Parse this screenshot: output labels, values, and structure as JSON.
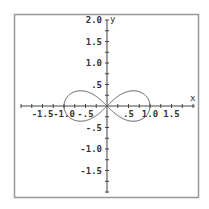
{
  "chart_data": {
    "type": "line",
    "title": "",
    "xlabel": "x",
    "ylabel": "y",
    "xlim": [
      -2.0,
      2.0
    ],
    "ylim": [
      -2.0,
      2.0
    ],
    "grid": false,
    "legend": null,
    "x_ticks": [
      {
        "value": -1.5,
        "label": "-1.5"
      },
      {
        "value": -1.0,
        "label": "-1.0"
      },
      {
        "value": -0.5,
        "label": "-.5"
      },
      {
        "value": 0.5,
        "label": ".5"
      },
      {
        "value": 1.0,
        "label": "1.0"
      },
      {
        "value": 1.5,
        "label": "1.5"
      }
    ],
    "y_ticks": [
      {
        "value": 2.0,
        "label": "2.0"
      },
      {
        "value": 1.5,
        "label": "1.5"
      },
      {
        "value": 1.0,
        "label": "1.0"
      },
      {
        "value": 0.5,
        "label": ".5"
      },
      {
        "value": -0.5,
        "label": "-.5"
      },
      {
        "value": -1.0,
        "label": "-1.0"
      },
      {
        "value": -1.5,
        "label": "-1.5"
      }
    ],
    "series": [
      {
        "name": "lemniscate",
        "equation": "r^2 = cos(2θ)",
        "color": "#555555",
        "points": [
          [
            1.0,
            0.0
          ],
          [
            0.95,
            0.17
          ],
          [
            0.85,
            0.28
          ],
          [
            0.7,
            0.35
          ],
          [
            0.55,
            0.35
          ],
          [
            0.4,
            0.3
          ],
          [
            0.2,
            0.18
          ],
          [
            0.0,
            0.0
          ],
          [
            -0.2,
            -0.18
          ],
          [
            -0.4,
            -0.3
          ],
          [
            -0.55,
            -0.35
          ],
          [
            -0.7,
            -0.35
          ],
          [
            -0.85,
            -0.28
          ],
          [
            -0.95,
            -0.17
          ],
          [
            -1.0,
            0.0
          ],
          [
            -0.95,
            0.17
          ],
          [
            -0.85,
            0.28
          ],
          [
            -0.7,
            0.35
          ],
          [
            -0.55,
            0.35
          ],
          [
            -0.4,
            0.3
          ],
          [
            -0.2,
            0.18
          ],
          [
            0.0,
            0.0
          ],
          [
            0.2,
            -0.18
          ],
          [
            0.4,
            -0.3
          ],
          [
            0.55,
            -0.35
          ],
          [
            0.7,
            -0.35
          ],
          [
            0.85,
            -0.28
          ],
          [
            0.95,
            -0.17
          ],
          [
            1.0,
            0.0
          ]
        ]
      }
    ]
  },
  "colors": {
    "frame": "#999999",
    "axis": "#444444",
    "curve": "#555555",
    "text": "#333333"
  }
}
